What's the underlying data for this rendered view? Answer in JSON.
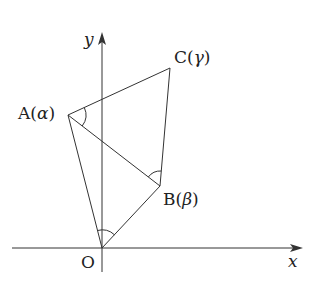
{
  "diagram": {
    "type": "complex-plane-geometry",
    "axes": {
      "x_label": "x",
      "y_label": "y",
      "origin_label": "O"
    },
    "points": [
      {
        "name": "A",
        "complex": "α",
        "label": "A(α)",
        "x": 68,
        "y": 115
      },
      {
        "name": "B",
        "complex": "β",
        "label": "B(β)",
        "x": 160,
        "y": 186
      },
      {
        "name": "C",
        "complex": "γ",
        "label": "C(γ)",
        "x": 170,
        "y": 68
      },
      {
        "name": "O",
        "label": "O",
        "x": 102,
        "y": 248
      }
    ],
    "segments": [
      "OA",
      "OB",
      "AB",
      "AC",
      "BC"
    ],
    "angle_marks": [
      {
        "vertex": "A",
        "between": [
          "AC",
          "AB"
        ]
      },
      {
        "vertex": "B",
        "between": [
          "BA",
          "BC"
        ]
      },
      {
        "vertex": "O",
        "between": [
          "OA",
          "OB"
        ]
      }
    ],
    "labels": {
      "A_name": "A",
      "A_arg": "α",
      "B_name": "B",
      "B_arg": "β",
      "C_name": "C",
      "C_arg": "γ",
      "O": "O",
      "x": "x",
      "y": "y",
      "open": "(",
      "close": ")"
    },
    "colors": {
      "stroke": "#333333",
      "text": "#222222",
      "background": "#ffffff"
    }
  }
}
